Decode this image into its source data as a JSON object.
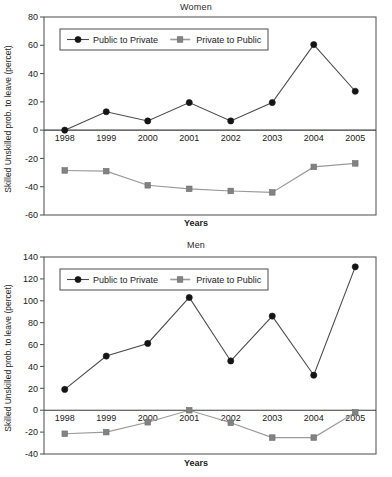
{
  "chart_data": [
    {
      "type": "line",
      "title": "Women",
      "xlabel": "Years",
      "ylabel": "Skilled Unskilled prob. to leave (percet)",
      "categories": [
        "1998",
        "1999",
        "2000",
        "2001",
        "2002",
        "2003",
        "2004",
        "2005"
      ],
      "ylim": [
        -60,
        80
      ],
      "yticks": [
        80,
        60,
        40,
        20,
        0,
        -20,
        -40,
        -60
      ],
      "ytick_labels": [
        "80",
        "60",
        "40",
        "20",
        "0",
        "-20",
        "-40",
        "-60"
      ],
      "grid": false,
      "legend_position": "top-left-inside",
      "series": [
        {
          "name": "Public to Private",
          "marker": "circle",
          "color": "#151515",
          "line_color": "#4a4a4a",
          "values": [
            0,
            13,
            6.5,
            19.5,
            6.5,
            19.5,
            60.5,
            27.5
          ]
        },
        {
          "name": "Private to Public",
          "marker": "square",
          "color": "#828282",
          "line_color": "#9a9a9a",
          "values": [
            -28.5,
            -29,
            -39,
            -41.5,
            -43,
            -44,
            -26,
            -23.5
          ]
        }
      ]
    },
    {
      "type": "line",
      "title": "Men",
      "xlabel": "Years",
      "ylabel": "Skilled Unskilled prob. to leave (percet)",
      "categories": [
        "1998",
        "1999",
        "2000",
        "2001",
        "2002",
        "2003",
        "2004",
        "2005"
      ],
      "ylim": [
        -40,
        140
      ],
      "yticks": [
        140,
        120,
        100,
        80,
        60,
        40,
        20,
        0,
        -20,
        -40
      ],
      "ytick_labels": [
        "140",
        "120",
        "100",
        "80",
        "60",
        "40",
        "20",
        "0",
        "-20",
        "-40"
      ],
      "grid": false,
      "legend_position": "top-left-inside",
      "series": [
        {
          "name": "Public to Private",
          "marker": "circle",
          "color": "#151515",
          "line_color": "#4a4a4a",
          "values": [
            19,
            49.5,
            61,
            103,
            45,
            86,
            32,
            131
          ]
        },
        {
          "name": "Private to Public",
          "marker": "square",
          "color": "#828282",
          "line_color": "#9a9a9a",
          "values": [
            -21.5,
            -20,
            -11,
            0,
            -11.5,
            -25,
            -25,
            -2
          ]
        }
      ]
    }
  ],
  "figures": {
    "women": {
      "title": "Women",
      "xlabel": "Years",
      "ylabel": "Skilled Unskilled prob. to leave (percet)"
    },
    "men": {
      "title": "Men",
      "xlabel": "Years",
      "ylabel": "Skilled Unskilled prob. to leave (percet)"
    }
  },
  "colors": {
    "public_to_private": "#151515",
    "private_to_public": "#828282",
    "frame": "#5b5b5b",
    "background": "#ffffff"
  }
}
